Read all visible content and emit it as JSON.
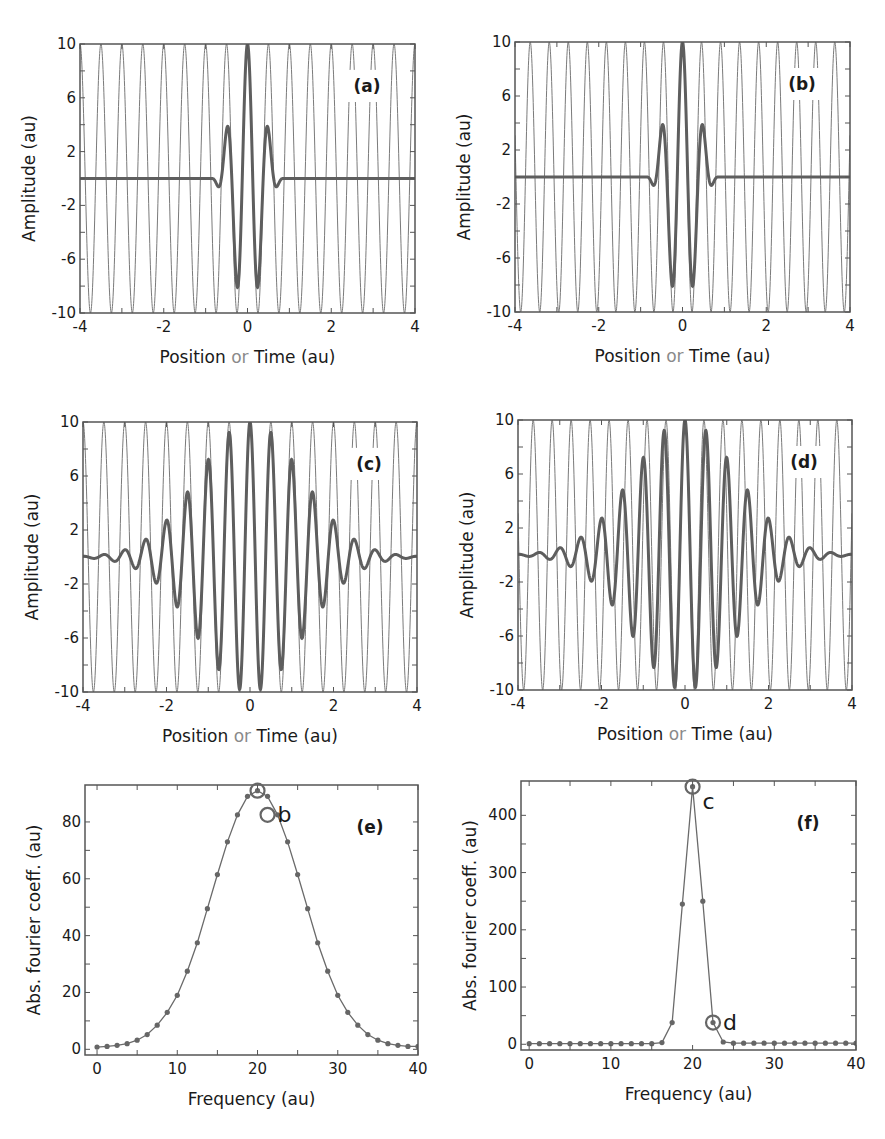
{
  "figure": {
    "width": 885,
    "height": 1139,
    "colors": {
      "frame": "#555555",
      "carrier": "#7a7a7a",
      "packet": "#5e5e5e",
      "spectrum_line": "#6a6a6a",
      "marker": "#666666",
      "text": "#1a1a1a",
      "or_word": "#8a8a8a"
    }
  },
  "chart_data": [
    {
      "id": "a",
      "type": "line",
      "panel_label": "(a)",
      "title": "",
      "xlabel": "Position or Time (au)",
      "xlabel_parts": [
        "Position ",
        "or",
        " Time (au)"
      ],
      "ylabel": "Amplitude (au)",
      "xlim": [
        -4,
        4
      ],
      "ylim": [
        -10,
        10
      ],
      "xticks": [
        -4,
        -2,
        0,
        2,
        4
      ],
      "yticks": [
        -10,
        -6,
        -2,
        2,
        6,
        10
      ],
      "grid": false,
      "box": {
        "x": 80,
        "y": 44,
        "w": 335,
        "h": 269
      },
      "series": [
        {
          "name": "carrier wave",
          "kind": "cosine",
          "amplitude": 10,
          "frequency": 2.0,
          "phase_zero_at": 0.0,
          "width": 1
        },
        {
          "name": "wave packet (few components, narrow)",
          "kind": "packet",
          "amplitude": 10,
          "frequency": 2.0,
          "envelope_sigma": 0.25,
          "envelope_shape": "compact",
          "support": 0.85,
          "width": 3
        }
      ],
      "annotations": [
        {
          "text": "peak 10 at x=0; side lobes +2.3 at x=±0.45; minima -7 at x=±0.22; flat 0 beyond |x|>0.85"
        }
      ]
    },
    {
      "id": "b",
      "type": "line",
      "panel_label": "(b)",
      "title": "",
      "xlabel": "Position or Time (au)",
      "xlabel_parts": [
        "Position ",
        "or",
        " Time (au)"
      ],
      "ylabel": "Amplitude (au)",
      "xlim": [
        -4,
        4
      ],
      "ylim": [
        -10,
        10
      ],
      "xticks": [
        -4,
        -2,
        0,
        2,
        4
      ],
      "yticks": [
        -10,
        -6,
        -2,
        2,
        6,
        10
      ],
      "grid": false,
      "box": {
        "x": 515,
        "y": 42,
        "w": 335,
        "h": 270
      },
      "series": [
        {
          "name": "carrier wave",
          "kind": "cosine",
          "amplitude": 10,
          "frequency": 2.2,
          "phase_zero_at": 0.0,
          "width": 1
        },
        {
          "name": "wave packet (few components, narrow)",
          "kind": "packet",
          "amplitude": 10,
          "frequency": 2.0,
          "envelope_sigma": 0.25,
          "envelope_shape": "compact",
          "support": 0.85,
          "width": 3
        }
      ],
      "annotations": [
        {
          "text": "carrier slightly higher frequency than (a), matching point b in (e)"
        }
      ]
    },
    {
      "id": "c",
      "type": "line",
      "panel_label": "(c)",
      "title": "",
      "xlabel": "Position or Time (au)",
      "xlabel_parts": [
        "Position ",
        "or",
        " Time (au)"
      ],
      "ylabel": "Amplitude (au)",
      "xlim": [
        -4,
        4
      ],
      "ylim": [
        -10,
        10
      ],
      "xticks": [
        -4,
        -2,
        0,
        2,
        4
      ],
      "yticks": [
        -10,
        -6,
        -2,
        2,
        6,
        10
      ],
      "grid": false,
      "box": {
        "x": 83,
        "y": 422,
        "w": 334,
        "h": 270
      },
      "series": [
        {
          "name": "carrier wave",
          "kind": "cosine",
          "amplitude": 10,
          "frequency": 2.0,
          "phase_zero_at": 0.0,
          "width": 1
        },
        {
          "name": "wave packet (broad envelope)",
          "kind": "packet",
          "amplitude": 10,
          "frequency": 2.0,
          "envelope_sigma": 1.3,
          "envelope_shape": "sinc",
          "support": 4,
          "width": 3
        }
      ],
      "annotations": [
        {
          "text": "peaks: 10 (0), 9.5 (±0.5), 7.8 (±1), 5.7 (±1.5), 3.7 (±2), 2.1 (±2.5), 1 (±3), 0.5 (±3.5)"
        }
      ]
    },
    {
      "id": "d",
      "type": "line",
      "panel_label": "(d)",
      "title": "",
      "xlabel": "Position or Time (au)",
      "xlabel_parts": [
        "Position ",
        "or",
        " Time (au)"
      ],
      "ylabel": "Amplitude (au)",
      "xlim": [
        -4,
        4
      ],
      "ylim": [
        -10,
        10
      ],
      "xticks": [
        -4,
        -2,
        0,
        2,
        4
      ],
      "yticks": [
        -10,
        -6,
        -2,
        2,
        6,
        10
      ],
      "grid": false,
      "box": {
        "x": 518,
        "y": 420,
        "w": 334,
        "h": 270
      },
      "series": [
        {
          "name": "carrier wave",
          "kind": "cosine",
          "amplitude": 10,
          "frequency": 2.2,
          "phase_zero_at": 0.0,
          "width": 1
        },
        {
          "name": "wave packet (broad envelope)",
          "kind": "packet",
          "amplitude": 10,
          "frequency": 2.0,
          "envelope_sigma": 1.3,
          "envelope_shape": "sinc",
          "support": 4,
          "width": 3
        }
      ],
      "annotations": [
        {
          "text": "carrier corresponds to point d in (f)"
        }
      ]
    },
    {
      "id": "e",
      "type": "line",
      "panel_label": "(e)",
      "title": "",
      "xlabel": "Frequency (au)",
      "ylabel": "Abs. fourier coeff. (au)",
      "xlim": [
        -1.5,
        40
      ],
      "ylim": [
        -2,
        93
      ],
      "xticks": [
        0,
        10,
        20,
        30,
        40
      ],
      "yticks": [
        0,
        20,
        40,
        60,
        80
      ],
      "grid": false,
      "box": {
        "x": 85,
        "y": 785,
        "w": 333,
        "h": 270
      },
      "x": [
        0,
        1.25,
        2.5,
        3.75,
        5,
        6.25,
        7.5,
        8.75,
        10,
        11.25,
        12.5,
        13.75,
        15,
        16.25,
        17.5,
        18.75,
        20,
        21.25,
        22.5,
        23.75,
        25,
        26.25,
        27.5,
        28.75,
        30,
        31.25,
        32.5,
        33.75,
        35,
        36.25,
        37.5,
        38.75,
        40
      ],
      "values": [
        0.8,
        1.0,
        1.4,
        2.0,
        3.2,
        5.2,
        8.5,
        13,
        19,
        27.5,
        37.5,
        49.5,
        61.5,
        73,
        82.5,
        89,
        91,
        89,
        82.5,
        73,
        61.5,
        49.5,
        37.5,
        27.5,
        19,
        13,
        8.5,
        5.2,
        3.2,
        2.0,
        1.4,
        1.0,
        1.0
      ],
      "series": [
        {
          "name": "spectrum (a/b)",
          "values_ref": "values"
        }
      ],
      "markers": [
        {
          "label": "",
          "x": 20,
          "y": 91
        },
        {
          "label": "b",
          "x": 21.25,
          "y": 82.5
        }
      ]
    },
    {
      "id": "f",
      "type": "line",
      "panel_label": "(f)",
      "title": "",
      "xlabel": "Frequency (au)",
      "ylabel": "Abs. fourier coeff. (au)",
      "xlim": [
        -1,
        40
      ],
      "ylim": [
        -10,
        460
      ],
      "xticks": [
        0,
        10,
        20,
        30,
        40
      ],
      "yticks": [
        0,
        100,
        200,
        300,
        400
      ],
      "grid": false,
      "box": {
        "x": 521,
        "y": 781,
        "w": 335,
        "h": 269
      },
      "x": [
        0,
        1.25,
        2.5,
        3.75,
        5,
        6.25,
        7.5,
        8.75,
        10,
        11.25,
        12.5,
        13.75,
        15,
        16.25,
        17.5,
        18.75,
        20,
        21.25,
        22.5,
        23.75,
        25,
        26.25,
        27.5,
        28.75,
        30,
        31.25,
        32.5,
        33.75,
        35,
        36.25,
        37.5,
        38.75,
        40
      ],
      "values": [
        1,
        1,
        1,
        1,
        1,
        1,
        1,
        1,
        1,
        1,
        1,
        1,
        1,
        3,
        38,
        245,
        450,
        250,
        38,
        4,
        2,
        2,
        2,
        2,
        2,
        2,
        2,
        2,
        2,
        2,
        2,
        2,
        2
      ],
      "series": [
        {
          "name": "spectrum (c/d)",
          "values_ref": "values"
        }
      ],
      "markers": [
        {
          "label": "c",
          "x": 20,
          "y": 450
        },
        {
          "label": "d",
          "x": 22.5,
          "y": 38
        }
      ]
    }
  ]
}
